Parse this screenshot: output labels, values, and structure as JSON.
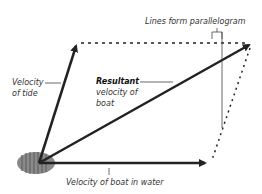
{
  "diagram": {
    "labels": {
      "parallelogram": "Lines form parallelogram",
      "tide_line1": "Velocity",
      "tide_line2": "of tide",
      "resultant_bold": "Resultant",
      "resultant_line2": "velocity of",
      "resultant_line3": "boat",
      "water": "Velocity of boat in water"
    },
    "vectors": [
      {
        "name": "velocity-of-tide",
        "from": [
          39,
          163
        ],
        "to": [
          77,
          43
        ]
      },
      {
        "name": "resultant-velocity",
        "from": [
          39,
          163
        ],
        "to": [
          252,
          43
        ]
      },
      {
        "name": "velocity-in-water",
        "from": [
          39,
          163
        ],
        "to": [
          209,
          163
        ]
      }
    ],
    "colors": {
      "arrow": "#222222",
      "boat_fill": "#8a8a8a",
      "boat_stripes": "#5a5a5a",
      "text": "#333333"
    }
  }
}
